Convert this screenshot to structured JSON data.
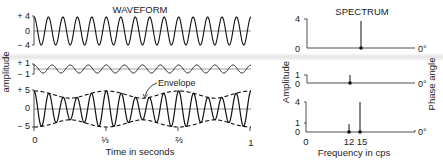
{
  "chart_data": [
    {
      "type": "line",
      "title": "WAVEFORM",
      "xlabel": "Time in seconds",
      "ylabel": "amplitude",
      "x_range": [
        0,
        1
      ],
      "x_ticks": [
        "0",
        "1/3",
        "2/3",
        "1"
      ],
      "panels": [
        {
          "name": "15 cps component",
          "frequency": 15,
          "amplitude": 4,
          "phase_deg": 0,
          "y_ticks": [
            "+4",
            "0",
            "-4"
          ],
          "ylim": [
            -4,
            4
          ]
        },
        {
          "name": "12 cps component",
          "frequency": 12,
          "amplitude": 1,
          "phase_deg": 0,
          "y_ticks": [
            "+1",
            "-1"
          ],
          "ylim": [
            -1,
            1
          ]
        },
        {
          "name": "sum",
          "components": [
            {
              "frequency": 15,
              "amplitude": 4
            },
            {
              "frequency": 12,
              "amplitude": 1
            }
          ],
          "y_ticks": [
            "+5",
            "0",
            "-5"
          ],
          "ylim": [
            -5,
            5
          ],
          "annotation": "Envelope",
          "envelope_beat_frequency": 3
        }
      ]
    },
    {
      "type": "bar",
      "title": "SPECTRUM",
      "xlabel": "Frequency in cps",
      "ylabel_left": "Amplitude",
      "ylabel_right": "Phase angle",
      "x_ticks": [
        "0",
        "12",
        "15"
      ],
      "panels": [
        {
          "categories": [
            15
          ],
          "values": [
            4
          ],
          "y_ticks": [
            "4",
            "0"
          ],
          "phase_label": "0°"
        },
        {
          "categories": [
            12
          ],
          "values": [
            1
          ],
          "y_ticks": [
            "1",
            "0"
          ],
          "phase_label": "0°"
        },
        {
          "categories": [
            12,
            15
          ],
          "values": [
            1,
            4
          ],
          "y_ticks": [
            "4",
            "1",
            "0"
          ],
          "phase_label": "0°"
        }
      ]
    }
  ],
  "labels": {
    "waveform_title": "WAVEFORM",
    "spectrum_title": "SPECTRUM",
    "amplitude_left": "amplitude",
    "time_axis": "Time in seconds",
    "envelope": "Envelope",
    "amplitude_spectrum": "Amplitude",
    "phase_angle": "Phase angle",
    "frequency_axis": "Frequency in cps",
    "w1_ticks": [
      "+ 4",
      "0",
      "− 4"
    ],
    "w2_ticks": [
      "+ 1",
      "− 1"
    ],
    "w3_ticks": [
      "+ 5",
      "0",
      "− 5"
    ],
    "time_ticks": [
      "0",
      "⅓",
      "⅔",
      "1"
    ],
    "s1_ticks": [
      "4",
      "0"
    ],
    "s2_ticks": [
      "1",
      "0"
    ],
    "s3_ticks": [
      "4",
      "1",
      "0"
    ],
    "freq_ticks": [
      "0",
      "12",
      "15"
    ],
    "phase_zero": "0°"
  }
}
